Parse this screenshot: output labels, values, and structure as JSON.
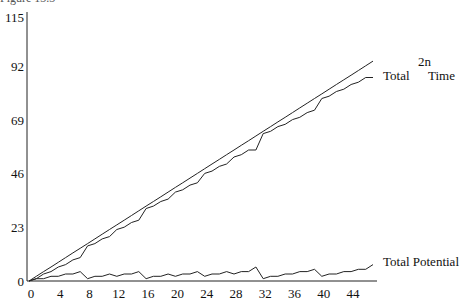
{
  "caption": "Figure 13.3",
  "chart_data": {
    "type": "line",
    "title": "",
    "xlabel": "",
    "ylabel": "",
    "xlim": [
      0,
      47
    ],
    "ylim": [
      0,
      115
    ],
    "grid": false,
    "x_ticks": [
      0,
      4,
      8,
      12,
      16,
      20,
      24,
      28,
      32,
      36,
      40,
      44
    ],
    "y_ticks": [
      0,
      23,
      46,
      69,
      92,
      115
    ],
    "x": [
      0,
      1,
      2,
      3,
      4,
      5,
      6,
      7,
      8,
      9,
      10,
      11,
      12,
      13,
      14,
      15,
      16,
      17,
      18,
      19,
      20,
      21,
      22,
      23,
      24,
      25,
      26,
      27,
      28,
      29,
      30,
      31,
      32,
      33,
      34,
      35,
      36,
      37,
      38,
      39,
      40,
      41,
      42,
      43,
      44,
      45,
      46,
      47
    ],
    "series": [
      {
        "name": "Total 2n",
        "label_line1": "Total",
        "label_sup": "2n",
        "values": [
          0,
          2,
          4,
          6,
          8,
          10,
          12,
          14,
          16,
          18,
          20,
          22,
          24,
          26,
          28,
          30,
          32,
          34,
          36,
          38,
          40,
          42,
          44,
          46,
          48,
          50,
          52,
          54,
          56,
          58,
          60,
          62,
          64,
          66,
          68,
          70,
          72,
          74,
          76,
          78,
          80,
          82,
          84,
          86,
          88,
          90,
          92,
          94
        ]
      },
      {
        "name": "Total Time",
        "label_line1": "Time",
        "values": [
          0,
          1,
          3,
          4,
          6,
          7,
          9,
          10,
          15,
          16,
          18,
          19,
          22,
          23,
          25,
          26,
          31,
          32,
          34,
          35,
          38,
          39,
          41,
          42,
          46,
          47,
          49,
          50,
          53,
          54,
          56,
          56,
          63,
          64,
          66,
          67,
          69,
          70,
          72,
          73,
          78,
          79,
          81,
          82,
          84,
          85,
          87,
          87
        ]
      },
      {
        "name": "Total Potential",
        "label_line1": "Total Potential",
        "values": [
          0,
          1,
          1,
          2,
          2,
          3,
          3,
          4,
          1,
          2,
          2,
          3,
          2,
          3,
          3,
          4,
          1,
          2,
          2,
          3,
          2,
          3,
          3,
          4,
          2,
          3,
          3,
          4,
          3,
          4,
          4,
          6,
          1,
          2,
          2,
          3,
          3,
          4,
          4,
          5,
          2,
          3,
          3,
          4,
          4,
          5,
          5,
          7
        ]
      }
    ],
    "annotations": [
      {
        "text": "Total",
        "x": 47,
        "y": 90
      },
      {
        "text": "2n",
        "x": 47,
        "y": 100,
        "note": "superscript above between Total and Time"
      },
      {
        "text": "Time",
        "x": 47,
        "y": 90
      },
      {
        "text": "Total Potential",
        "x": 47,
        "y": 7
      }
    ]
  },
  "labels": {
    "total": "Total",
    "sup": "2n",
    "time": "Time",
    "potential": "Total Potential"
  }
}
